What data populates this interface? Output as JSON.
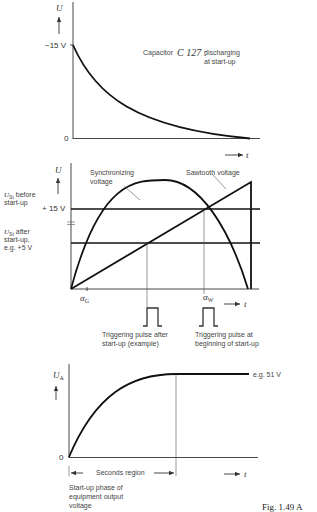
{
  "panel_top": {
    "y_axis_label": "U",
    "y_tick_high": "−15 V",
    "y_tick_zero": "0",
    "x_axis_label": "t",
    "annotation_prefix": "Capacitor",
    "annotation_component": "C 127 :",
    "annotation_line1": "discharging",
    "annotation_line2": "at start-up"
  },
  "panel_middle": {
    "y_axis_label": "U",
    "y_tick_high": "+ 15 V",
    "ust_before_line1": "U",
    "ust_before_sub": "St",
    "ust_before_line1_rest": " before",
    "ust_before_line2": "start-up",
    "ust_after_line1": "U",
    "ust_after_sub": "St",
    "ust_after_line1_rest": " after",
    "ust_after_line2": "start-up,",
    "ust_after_line3": "e.g. +5 V",
    "sync_label_line1": "Synchronizing",
    "sync_label_line2": "voltage",
    "sawtooth_label": "Sawtooth voltage",
    "alpha_g": "α",
    "alpha_g_sub": "G",
    "alpha_w": "α",
    "alpha_w_sub": "W",
    "x_axis_label": "t",
    "pulse1_line1": "Triggering pulse after",
    "pulse1_line2": "start-up (example)",
    "pulse2_line1": "Triggering pulse at",
    "pulse2_line2": "beginning of start-up"
  },
  "panel_bottom": {
    "y_axis_label": "U",
    "y_axis_sub": "A",
    "y_tick_zero": "0",
    "plateau_label": "e.g. 51 V",
    "region_label": "Seconds region",
    "x_axis_label": "t",
    "caption_line1": "Start-up phase of",
    "caption_line2": "equipment output",
    "caption_line3": "voltage"
  },
  "figure_caption": "Fig. 1.49   A"
}
